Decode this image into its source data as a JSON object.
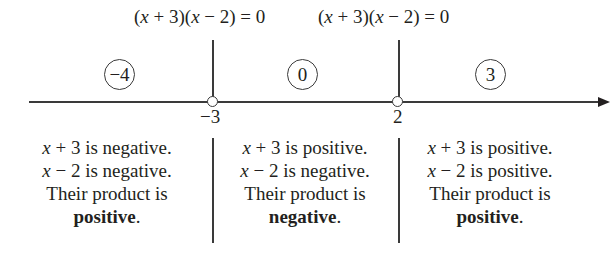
{
  "figure": {
    "equations": [
      {
        "label": "(x + 3)(x − 2) = 0",
        "parts": [
          "(",
          "x",
          " + 3)(",
          "x",
          " − 2) = 0"
        ]
      },
      {
        "label": "(x + 3)(x − 2) = 0",
        "parts": [
          "(",
          "x",
          " + 3)(",
          "x",
          " − 2) = 0"
        ]
      }
    ],
    "number_line": {
      "critical_points": [
        {
          "value": "−3"
        },
        {
          "value": "2"
        }
      ],
      "test_values": [
        "−4",
        "0",
        "3"
      ]
    },
    "intervals": [
      {
        "line1_var": "x",
        "line1_rest": " + 3 is negative.",
        "line2_var": "x",
        "line2_rest": " − 2 is negative.",
        "line3": "Their product is",
        "sign": "positive",
        "period": "."
      },
      {
        "line1_var": "x",
        "line1_rest": " + 3 is positive.",
        "line2_var": "x",
        "line2_rest": " − 2 is negative.",
        "line3": "Their product is",
        "sign": "negative",
        "period": "."
      },
      {
        "line1_var": "x",
        "line1_rest": " + 3 is positive.",
        "line2_var": "x",
        "line2_rest": " − 2 is positive.",
        "line3": "Their product is",
        "sign": "positive",
        "period": "."
      }
    ]
  }
}
